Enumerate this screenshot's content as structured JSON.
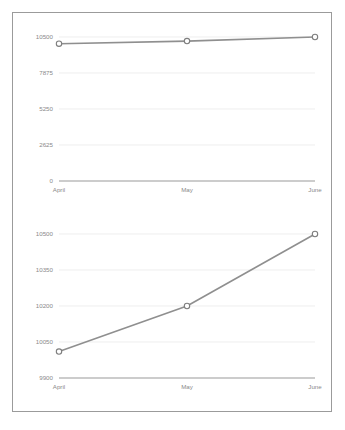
{
  "card": {
    "border_color": "#9b9b9b",
    "background_color": "#ffffff"
  },
  "palette": {
    "line_color": "#8f8f8f",
    "marker_stroke": "#7e7e7e",
    "marker_fill": "#ffffff",
    "gridline_color": "#e6e6e6",
    "axis_color": "#9a9a9a",
    "tick_label_color": "#8a8a8a"
  },
  "chart_data": [
    {
      "id": "chart-top",
      "type": "line",
      "title": "",
      "subtitle": "",
      "xlabel": "",
      "ylabel": "",
      "categories": [
        "April",
        "May",
        "June"
      ],
      "values": [
        10010,
        10200,
        10500
      ],
      "series": [
        {
          "name": "Series 1",
          "values": [
            10010,
            10200,
            10500
          ]
        }
      ],
      "ylim": [
        0,
        10500
      ],
      "yticks": [
        0,
        2625,
        5250,
        7875,
        10500
      ],
      "ytick_labels": [
        "0",
        "2625",
        "5250",
        "7875",
        "10500"
      ],
      "xtick_labels": [
        "April",
        "May",
        "June"
      ],
      "grid": true,
      "legend": false,
      "legend_position": "none",
      "markers": "circle-open",
      "annotations": []
    },
    {
      "id": "chart-bottom",
      "type": "line",
      "title": "",
      "subtitle": "",
      "xlabel": "",
      "ylabel": "",
      "categories": [
        "April",
        "May",
        "June"
      ],
      "values": [
        10010,
        10200,
        10500
      ],
      "series": [
        {
          "name": "Series 1",
          "values": [
            10010,
            10200,
            10500
          ]
        }
      ],
      "ylim": [
        9900,
        10500
      ],
      "yticks": [
        9900,
        10050,
        10200,
        10350,
        10500
      ],
      "ytick_labels": [
        "9900",
        "10050",
        "10200",
        "10350",
        "10500"
      ],
      "xtick_labels": [
        "April",
        "May",
        "June"
      ],
      "grid": true,
      "legend": false,
      "legend_position": "none",
      "markers": "circle-open",
      "annotations": []
    }
  ]
}
